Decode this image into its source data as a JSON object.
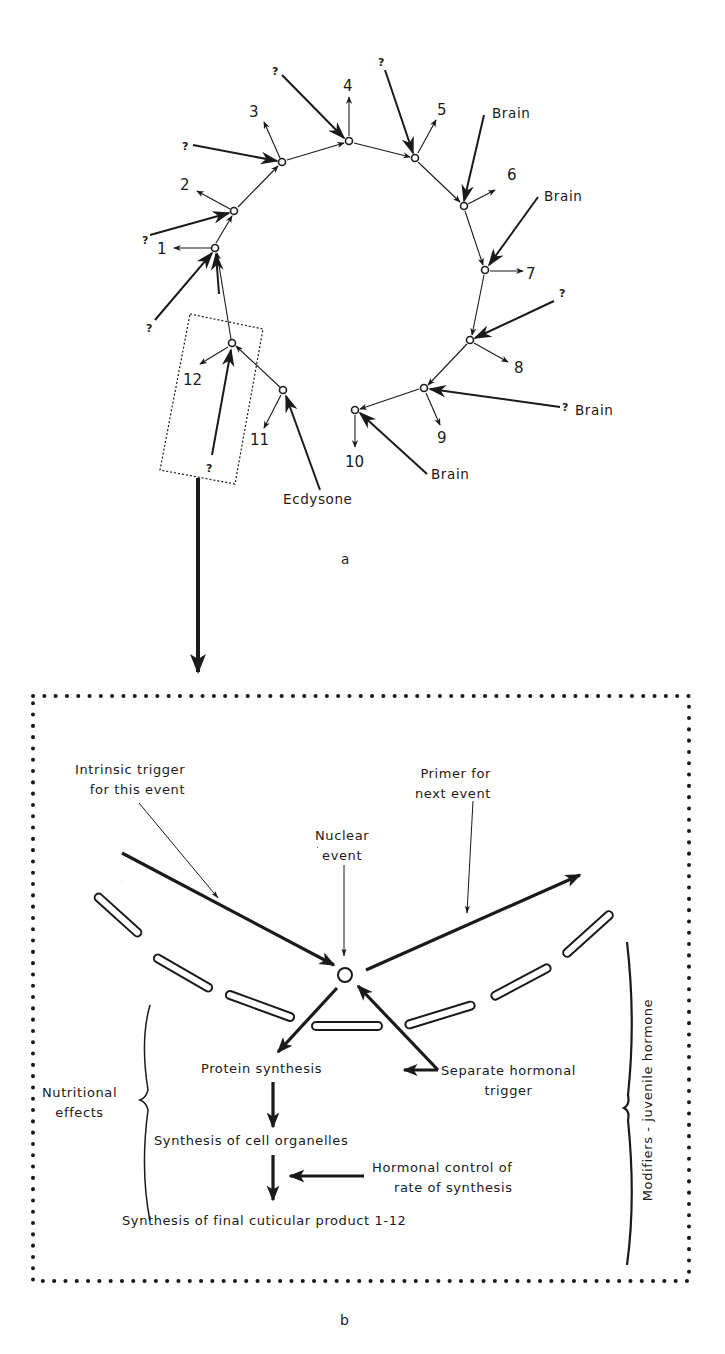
{
  "figure": {
    "part_a": {
      "caption": "a",
      "events": [
        {
          "id": 1,
          "label": "1",
          "input": "?"
        },
        {
          "id": 2,
          "label": "2",
          "input": "?"
        },
        {
          "id": 3,
          "label": "3",
          "input": "?"
        },
        {
          "id": 4,
          "label": "4",
          "input": "?"
        },
        {
          "id": 5,
          "label": "5",
          "input": "?"
        },
        {
          "id": 6,
          "label": "6",
          "input": "Brain"
        },
        {
          "id": 7,
          "label": "7",
          "input": "Brain"
        },
        {
          "id": 8,
          "label": "8",
          "input": "?"
        },
        {
          "id": 9,
          "label": "9",
          "input": "? Brain"
        },
        {
          "id": 10,
          "label": "10",
          "input": "Brain"
        },
        {
          "id": 11,
          "label": "11",
          "input": "Ecdysone"
        },
        {
          "id": 12,
          "label": "12",
          "input": "?"
        }
      ],
      "labels": {
        "q": "?",
        "brain": "Brain",
        "q_brain_q": "?",
        "ecdysone": "Ecdysone"
      }
    },
    "part_b": {
      "caption": "b",
      "intrinsic_trigger": [
        "Intrinsic trigger",
        "for this event"
      ],
      "primer": [
        "Primer for",
        "next event"
      ],
      "nuclear_event": [
        "Nuclear",
        "event"
      ],
      "protein_synthesis": "Protein synthesis",
      "separate_trigger": [
        "Separate hormonal",
        "trigger"
      ],
      "organelles": "Synthesis of cell organelles",
      "hormonal_control": [
        "Hormonal control of",
        "rate of synthesis"
      ],
      "final_product": "Synthesis of final cuticular product 1-12",
      "nutritional": [
        "Nutritional",
        "effects"
      ],
      "modifiers": "Modifiers - juvenile hormone"
    },
    "colors": {
      "ink": "#1a1a1a",
      "background": "#ffffff"
    }
  }
}
